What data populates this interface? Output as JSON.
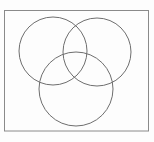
{
  "figure": {
    "canvas": {
      "width": 154,
      "height": 142,
      "background_color": "#fdfdfd"
    },
    "frame": {
      "name": "universal-set-rectangle",
      "x": 4.5,
      "y": 10.5,
      "width": 144,
      "height": 120.5,
      "stroke_color": "#8a8a8a",
      "stroke_width": 1,
      "fill": "none"
    },
    "circles": [
      {
        "name": "circle-top-left",
        "label": "",
        "cx": 53,
        "cy": 51,
        "r": 34,
        "stroke_color": "#6e6e6e",
        "stroke_width": 1,
        "fill": "none"
      },
      {
        "name": "circle-top-right",
        "label": "",
        "cx": 97,
        "cy": 52,
        "r": 34,
        "stroke_color": "#6e6e6e",
        "stroke_width": 1,
        "fill": "none"
      },
      {
        "name": "circle-bottom-center",
        "label": "",
        "cx": 76,
        "cy": 89,
        "r": 37,
        "stroke_color": "#6e6e6e",
        "stroke_width": 1,
        "fill": "none"
      }
    ],
    "labels": []
  }
}
